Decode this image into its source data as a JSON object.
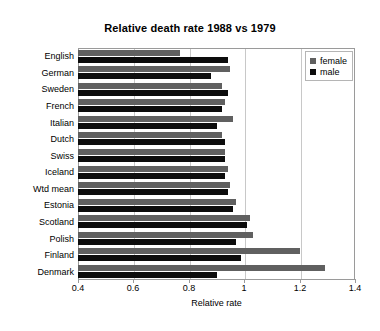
{
  "chart_data": {
    "type": "bar",
    "orientation": "horizontal",
    "title": "Relative death rate 1988 vs 1979",
    "xlabel": "Relative rate",
    "ylabel": "",
    "xlim": [
      0.4,
      1.4
    ],
    "xticks": [
      "0.4",
      "0.6",
      "0.8",
      "1",
      "1.2",
      "1.4"
    ],
    "xtick_values": [
      0.4,
      0.6,
      0.8,
      1.0,
      1.2,
      1.4
    ],
    "grid": true,
    "grid_axis": "x",
    "legend_position": "top-right",
    "categories": [
      "English",
      "German",
      "Sweden",
      "French",
      "Italian",
      "Dutch",
      "Swiss",
      "Iceland",
      "Wtd mean",
      "Estonia",
      "Scotland",
      "Polish",
      "Finland",
      "Denmark"
    ],
    "series": [
      {
        "name": "female",
        "color": "#606060",
        "values": [
          0.77,
          0.95,
          0.92,
          0.93,
          0.96,
          0.92,
          0.93,
          0.94,
          0.95,
          0.97,
          1.02,
          1.03,
          1.2,
          1.29
        ]
      },
      {
        "name": "male",
        "color": "#0c0c0c",
        "values": [
          0.94,
          0.88,
          0.94,
          0.92,
          0.9,
          0.93,
          0.93,
          0.93,
          0.94,
          0.96,
          1.01,
          0.97,
          0.99,
          0.9
        ]
      }
    ]
  },
  "legend": {
    "entries": [
      {
        "label": "female",
        "color": "#606060"
      },
      {
        "label": "male",
        "color": "#0c0c0c"
      }
    ]
  }
}
